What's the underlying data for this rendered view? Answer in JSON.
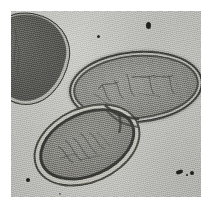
{
  "image": {
    "kind": "transmission-electron-micrograph",
    "subject": "dividing rod-shaped bacterial cells",
    "width_px": 213,
    "height_px": 208,
    "background_color": "#cdcdc9",
    "frame": {
      "left_px": 11,
      "top_px": 11,
      "width_px": 190,
      "height_px": 186,
      "margin_color": "#ffffff"
    },
    "palette": {
      "paper_white": "#ffffff",
      "substrate_gray": "#cdcdc9",
      "cytoplasm_gray": "#8a8a85",
      "envelope_dark": "#343431",
      "periplasm_light": "#bcbcb6",
      "debris_black": "#1d1d1b"
    }
  },
  "objects": [
    {
      "id": "cell-upper-right",
      "label": "upper right daughter cell",
      "shape": "ellipse",
      "center_px": [
        125,
        76
      ],
      "size_px": [
        134,
        72
      ],
      "rotation_deg": -5,
      "features": [
        "thick dark cell envelope",
        "light periplasmic layer",
        "fibrillar nucleoid"
      ]
    },
    {
      "id": "cell-lower-left",
      "label": "lower left daughter cell",
      "shape": "ellipse",
      "center_px": [
        76,
        134
      ],
      "size_px": [
        112,
        76
      ],
      "rotation_deg": -24,
      "features": [
        "detached outer capsule",
        "wide periplasmic space",
        "fibrillar nucleoid"
      ]
    },
    {
      "id": "cell-upper-left",
      "label": "partially cropped cell at frame edge",
      "shape": "ovoid",
      "center_px": [
        16,
        48
      ],
      "size_px": [
        84,
        92
      ],
      "rotation_deg": 10,
      "features": [
        "dark electron-dense cytoplasm",
        "clipped by left frame edge"
      ]
    },
    {
      "id": "septum",
      "label": "division septum between daughter cells",
      "center_px": [
        111,
        107
      ]
    }
  ],
  "specks": [
    {
      "id": "speck-1",
      "x": 146,
      "y": 22,
      "w": 5,
      "h": 7
    },
    {
      "id": "speck-2",
      "x": 97,
      "y": 35,
      "w": 3,
      "h": 3
    },
    {
      "id": "speck-3",
      "x": 176,
      "y": 170,
      "w": 7,
      "h": 4
    },
    {
      "id": "speck-4",
      "x": 190,
      "y": 171,
      "w": 4,
      "h": 4
    },
    {
      "id": "speck-5",
      "x": 26,
      "y": 178,
      "w": 4,
      "h": 4
    },
    {
      "id": "speck-6",
      "x": 186,
      "y": 174,
      "w": 2,
      "h": 2
    },
    {
      "id": "speck-7",
      "x": 59,
      "y": 193,
      "w": 2,
      "h": 2
    }
  ],
  "caption": {
    "text": ""
  }
}
